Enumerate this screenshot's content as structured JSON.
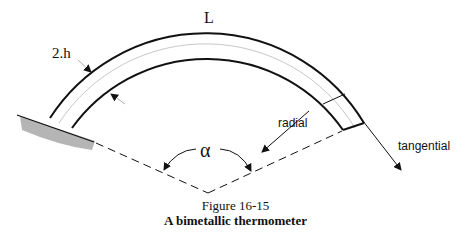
{
  "figure": {
    "labels": {
      "length": "L",
      "thickness": "2.h",
      "angle": "α",
      "radial": "radial",
      "tangential": "tangential"
    },
    "caption": {
      "number": "Figure 16-15",
      "title": "A bimetallic thermometer"
    },
    "colors": {
      "line": "#111111",
      "midline": "#c8c8c8",
      "support": "#b5b5b5",
      "background": "#ffffff"
    }
  }
}
